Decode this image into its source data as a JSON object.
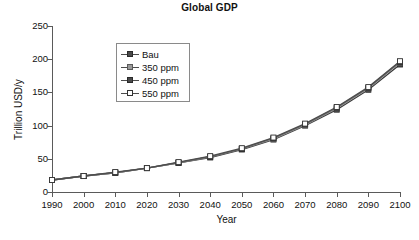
{
  "chart_data": {
    "type": "line",
    "title": "Global GDP",
    "xlabel": "Year",
    "ylabel": "Trillion USD/y",
    "x": [
      1990,
      2000,
      2010,
      2020,
      2030,
      2040,
      2050,
      2060,
      2070,
      2080,
      2090,
      2100
    ],
    "xticklabels": [
      "1990",
      "2000",
      "2010",
      "2020",
      "2030",
      "2040",
      "2050",
      "2060",
      "2070",
      "2080",
      "2090",
      "2100"
    ],
    "yticklabels": [
      "0",
      "50",
      "100",
      "150",
      "200",
      "250"
    ],
    "yticks": [
      0,
      50,
      100,
      150,
      200,
      250
    ],
    "xlim": [
      1990,
      2100
    ],
    "ylim": [
      0,
      250
    ],
    "grid": false,
    "legend_position": "upper-left-inside",
    "series": [
      {
        "name": "Bau",
        "marker": "filled-square-dark",
        "color": "#3a3a3a",
        "values": [
          18,
          24,
          29,
          36,
          44,
          52,
          64,
          79,
          100,
          124,
          154,
          192
        ]
      },
      {
        "name": "350 ppm",
        "marker": "filled-square-gray",
        "color": "#9a9a9a",
        "values": [
          18,
          24,
          29,
          36,
          44,
          53,
          65,
          80,
          101,
          126,
          156,
          195
        ]
      },
      {
        "name": "450 ppm",
        "marker": "filled-square-dark",
        "color": "#6a6a6a",
        "values": [
          18,
          24,
          29,
          36,
          44,
          53,
          65,
          81,
          102,
          127,
          157,
          196
        ]
      },
      {
        "name": "550 ppm",
        "marker": "open-square",
        "color": "#4d4d4d",
        "values": [
          18,
          24,
          30,
          36,
          45,
          54,
          66,
          82,
          103,
          128,
          158,
          197
        ]
      }
    ]
  }
}
